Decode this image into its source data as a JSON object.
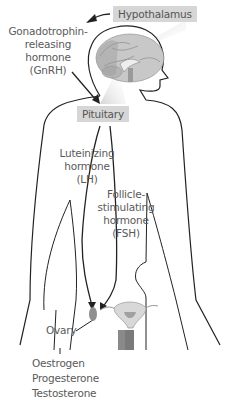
{
  "diagram": {
    "labels": {
      "hypothalamus": "Hypothalamus",
      "gnrh": [
        "Gonadotrophin-",
        "releasing",
        "hormone",
        "(GnRH)"
      ],
      "pituitary": "Pituitary",
      "lh": [
        "Luteinizing",
        "hormone",
        "(LH)"
      ],
      "fsh": [
        "Follicle-",
        "stimulating",
        "hormone",
        "(FSH)"
      ],
      "ovary": "Ovary",
      "ovary_hormones": [
        "Oestrogen",
        "Progesterone",
        "Testosterone"
      ]
    },
    "colors": {
      "outline": "#222222",
      "label_box": "#d6d6d6",
      "text": "#5a5a5a",
      "brain": "#a8a8a8",
      "uterus": "#9a9a9a"
    }
  }
}
